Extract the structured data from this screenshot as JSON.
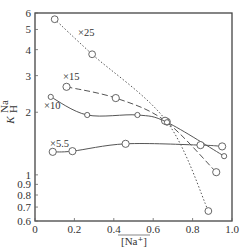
{
  "chart_data": {
    "type": "line",
    "title": "",
    "xlabel": "[Na⁺]",
    "ylabel": "K_H^Na",
    "xscale": "linear",
    "yscale": "log",
    "xlim": [
      0,
      1.0
    ],
    "ylim": [
      0.6,
      6
    ],
    "xticks": [
      "0",
      "0.2",
      "0.4",
      "0.6",
      "0.8",
      "1.0"
    ],
    "yticks": [
      "0.6",
      "0.7",
      "0.8",
      "0.9",
      "1",
      "2",
      "3",
      "4",
      "5",
      "6"
    ],
    "grid": false,
    "legend": "inline labels",
    "series": [
      {
        "name": "×25",
        "line_style": "dotted",
        "x": [
          0.1,
          0.29,
          0.67,
          0.88
        ],
        "y": [
          5.6,
          3.8,
          1.8,
          0.67
        ]
      },
      {
        "name": "×15",
        "line_style": "dashed",
        "x": [
          0.16,
          0.41,
          0.66,
          0.92
        ],
        "y": [
          2.65,
          2.34,
          1.82,
          1.03
        ]
      },
      {
        "name": "×10",
        "line_style": "solid",
        "x": [
          0.08,
          0.265,
          0.52,
          0.67,
          0.96
        ],
        "y": [
          2.37,
          1.94,
          1.94,
          1.79,
          1.23
        ]
      },
      {
        "name": "×5.5",
        "line_style": "solid",
        "x": [
          0.09,
          0.19,
          0.46,
          0.84,
          0.95
        ],
        "y": [
          1.29,
          1.3,
          1.41,
          1.39,
          1.37
        ]
      }
    ]
  }
}
